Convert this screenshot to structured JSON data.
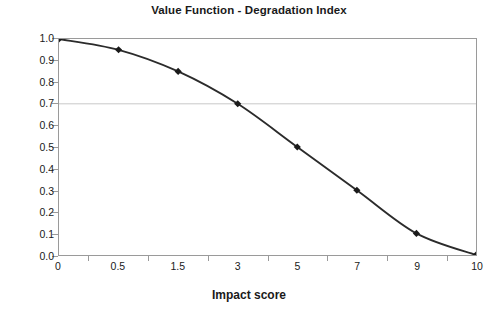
{
  "chart_data": {
    "type": "line",
    "title": "Value Function - Degradation Index",
    "xlabel": "Impact score",
    "ylabel": "",
    "categories": [
      "0",
      "0.5",
      "1.5",
      "3",
      "5",
      "7",
      "9",
      "10"
    ],
    "values": [
      1.0,
      0.95,
      0.85,
      0.7,
      0.5,
      0.3,
      0.1,
      0.0
    ],
    "series": [
      {
        "name": "Value Function",
        "values": [
          1.0,
          0.95,
          0.85,
          0.7,
          0.5,
          0.3,
          0.1,
          0.0
        ]
      }
    ],
    "ylim": [
      0.0,
      1.0
    ],
    "ytick_labels": [
      "1.0",
      "0.9",
      "0.8",
      "0.7",
      "0.6",
      "0.5",
      "0.4",
      "0.3",
      "0.2",
      "0.1",
      "0.0"
    ],
    "ytick_values": [
      1.0,
      0.9,
      0.8,
      0.7,
      0.6,
      0.5,
      0.4,
      0.3,
      0.2,
      0.1,
      0.0
    ],
    "grid": true,
    "gridlines_y": [
      0.7
    ],
    "legend": "none",
    "marker": "diamond",
    "colors": {
      "line": "#2b2b2b",
      "marker": "#1a1a1a",
      "gridline": "#c8c8c8",
      "axis": "#9a9a9a",
      "text": "#1a1a1a",
      "background": "#ffffff"
    }
  }
}
